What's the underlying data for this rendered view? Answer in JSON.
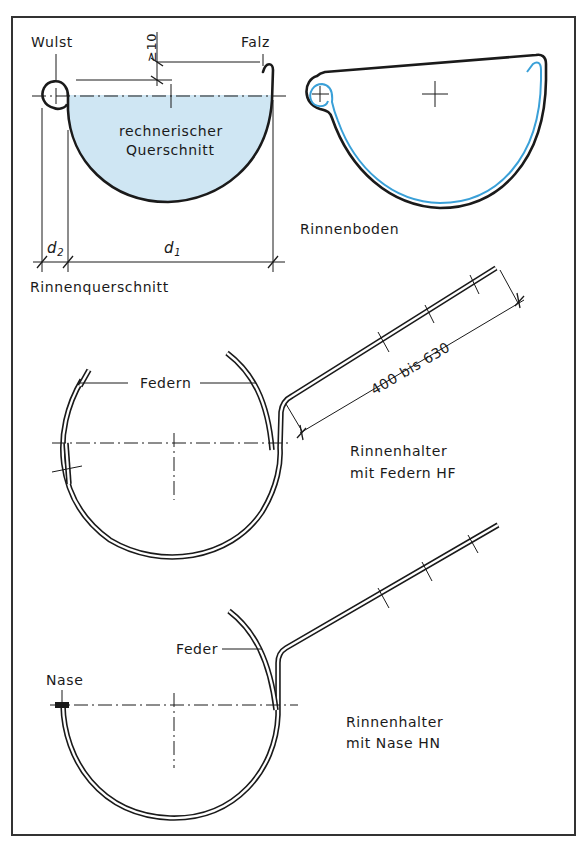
{
  "figure": {
    "frame_color": "#333333",
    "fill_color": "#cfe6f3",
    "highlight_color": "#3aa0d8",
    "line_color": "#1a1a1a"
  },
  "gutter_cross_section": {
    "title": "Rinnenquerschnitt",
    "label_bead": "Wulst",
    "label_fold": "Falz",
    "label_area_line1": "rechnerischer",
    "label_area_line2": "Querschnitt",
    "dim_min_gap": "≥10",
    "dim_d1": "d",
    "dim_d1_sub": "1",
    "dim_d2": "d",
    "dim_d2_sub": "2"
  },
  "gutter_end_cap": {
    "title": "Rinnenboden"
  },
  "hanger_springs": {
    "title_line1": "Rinnenhalter",
    "title_line2": "mit Federn HF",
    "label_springs": "Federn",
    "dim_length": "400 bis 630"
  },
  "hanger_nose": {
    "title_line1": "Rinnenhalter",
    "title_line2": "mit Nase HN",
    "label_spring": "Feder",
    "label_nose": "Nase"
  }
}
